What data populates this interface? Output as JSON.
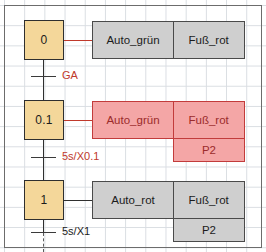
{
  "diagram": {
    "type": "sfc-sequential-function-chart",
    "colors": {
      "step_fill": "#f4d79a",
      "action_inactive_fill": "#cfcfcf",
      "action_active_fill": "#f4a6a6",
      "action_active_border": "#c23b3b",
      "active_text": "#9b2b2b",
      "grid_line": "#d9dde2",
      "frame": "#6c6c6c"
    },
    "steps": [
      {
        "id": "step-0",
        "label": "0",
        "active": false
      },
      {
        "id": "step-0-1",
        "label": "0.1",
        "active": true
      },
      {
        "id": "step-1",
        "label": "1",
        "active": false
      }
    ],
    "transitions": [
      {
        "id": "transition-ga",
        "label": "GA",
        "active": true
      },
      {
        "id": "transition-5s-x01",
        "label": "5s/X0.1",
        "active": true
      },
      {
        "id": "transition-5s-x1",
        "label": "5s/X1",
        "active": false
      }
    ],
    "action_blocks": [
      {
        "id": "actions-step-0",
        "state": "inactive",
        "rows": [
          {
            "cells": [
              "Auto_grün",
              "Fuß_rot"
            ]
          }
        ]
      },
      {
        "id": "actions-step-0-1",
        "state": "active",
        "rows": [
          {
            "cells": [
              "Auto_grün",
              "Fuß_rot"
            ]
          },
          {
            "cells": [
              "P2"
            ]
          }
        ]
      },
      {
        "id": "actions-step-1",
        "state": "inactive",
        "rows": [
          {
            "cells": [
              "Auto_rot",
              "Fuß_rot"
            ]
          },
          {
            "cells": [
              "P2"
            ]
          }
        ]
      }
    ]
  }
}
